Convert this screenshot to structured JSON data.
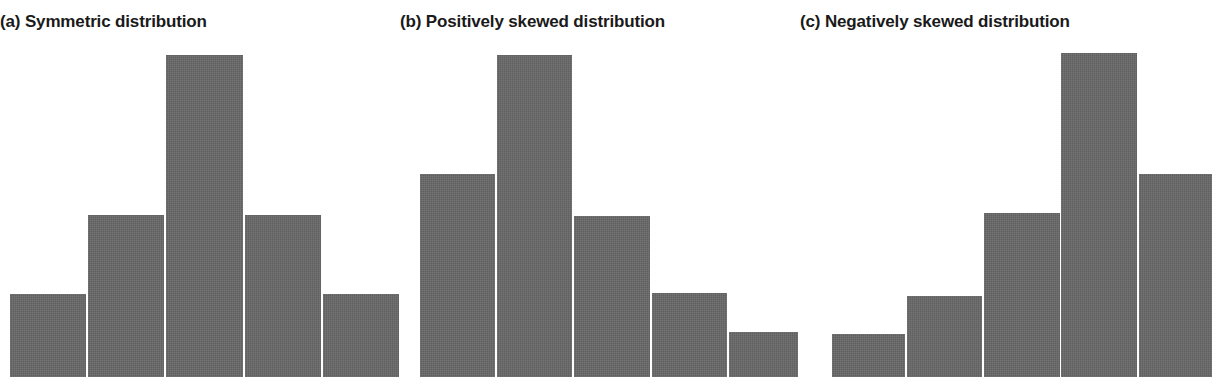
{
  "figure": {
    "background_color": "#ffffff",
    "bar_color": "#666666",
    "title_color": "#1a1a1a",
    "clipped_caption_fragment": "",
    "panels": [
      {
        "id": "a",
        "label": "(a) Symmetric distribution"
      },
      {
        "id": "b",
        "label": "(b) Positively skewed distribution"
      },
      {
        "id": "c",
        "label": "(c) Negatively skewed distribution"
      }
    ]
  },
  "chart_data": [
    {
      "type": "bar",
      "title": "(a) Symmetric distribution",
      "panel": "a",
      "categories": [
        "1",
        "2",
        "3",
        "4",
        "5"
      ],
      "values": [
        25,
        46,
        85,
        46,
        25
      ],
      "xlabel": "",
      "ylabel": "",
      "ylim": [
        0,
        100
      ],
      "grid": false,
      "legend": "none",
      "axis_ticks_shown": false,
      "bar_color": "#666666",
      "bar_geometry_px": [
        {
          "x": 10,
          "width": 76,
          "top": 294,
          "height": 83
        },
        {
          "x": 88,
          "width": 76,
          "top": 215,
          "height": 162
        },
        {
          "x": 166,
          "width": 77,
          "top": 55,
          "height": 322
        },
        {
          "x": 245,
          "width": 76,
          "top": 215,
          "height": 162
        },
        {
          "x": 323,
          "width": 76,
          "top": 294,
          "height": 83
        }
      ]
    },
    {
      "type": "bar",
      "title": "(b) Positively skewed distribution",
      "panel": "b",
      "categories": [
        "1",
        "2",
        "3",
        "4",
        "5"
      ],
      "values": [
        63,
        100,
        50,
        26,
        14
      ],
      "xlabel": "",
      "ylabel": "",
      "ylim": [
        0,
        100
      ],
      "grid": false,
      "legend": "none",
      "axis_ticks_shown": false,
      "bar_color": "#666666",
      "bar_geometry_px": [
        {
          "x": 20,
          "width": 75,
          "top": 174,
          "height": 203
        },
        {
          "x": 97,
          "width": 75,
          "top": 55,
          "height": 322
        },
        {
          "x": 174,
          "width": 76,
          "top": 216,
          "height": 161
        },
        {
          "x": 252,
          "width": 75,
          "top": 293,
          "height": 84
        },
        {
          "x": 329,
          "width": 69,
          "top": 332,
          "height": 45
        }
      ]
    },
    {
      "type": "bar",
      "title": "(c) Negatively skewed distribution",
      "panel": "c",
      "categories": [
        "1",
        "2",
        "3",
        "4",
        "5"
      ],
      "values": [
        13,
        25,
        51,
        101,
        63
      ],
      "xlabel": "",
      "ylabel": "",
      "ylim": [
        0,
        100
      ],
      "grid": false,
      "legend": "none",
      "axis_ticks_shown": false,
      "bar_color": "#666666",
      "bar_geometry_px": [
        {
          "x": 32,
          "width": 73,
          "top": 334,
          "height": 43
        },
        {
          "x": 107,
          "width": 75,
          "top": 296,
          "height": 81
        },
        {
          "x": 184,
          "width": 76,
          "top": 213,
          "height": 164
        },
        {
          "x": 261,
          "width": 76,
          "top": 53,
          "height": 324
        },
        {
          "x": 339,
          "width": 73,
          "top": 174,
          "height": 203
        }
      ]
    }
  ]
}
